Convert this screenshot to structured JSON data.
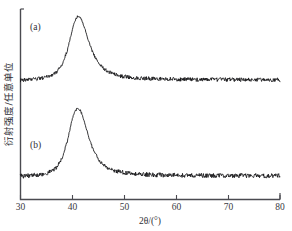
{
  "figure": {
    "kind": "xrd-pattern",
    "background_color": "#ffffff",
    "frame_color": "#4a4a50",
    "trace_color": "#121214"
  },
  "axes": {
    "x_title": "2θ/(°)",
    "y_title": "衍射强度/任意单位",
    "x_ticks": [
      "30",
      "40",
      "50",
      "60",
      "70",
      "80"
    ],
    "x_tick_values": [
      30,
      40,
      50,
      60,
      70,
      80
    ],
    "x_min": 30,
    "x_max": 80,
    "y_ticks": [],
    "y_tick_labels_shown": false
  },
  "annotations": {
    "curve_a_label": "(a)",
    "curve_b_label": "(b)"
  },
  "chart_data": {
    "type": "line",
    "title": "",
    "subtitle": "",
    "xlabel": "2θ/(°)",
    "ylabel": "衍射强度/任意单位",
    "xlim": [
      30,
      80
    ],
    "ylim": [
      0,
      2
    ],
    "grid": false,
    "legend": "none",
    "annotations": [
      {
        "text": "(a)",
        "x": 31.8,
        "y_frac": 0.88
      },
      {
        "text": "(b)",
        "x": 31.8,
        "y_frac": 0.32
      }
    ],
    "series": [
      {
        "name": "(a)",
        "peak_center": 41.2,
        "peak_fwhm": 7.6,
        "peak_height": 1.0,
        "baseline": 0.0,
        "offset": 1.0,
        "noise": 0.028,
        "x": [
          30,
          31,
          32,
          33,
          34,
          35,
          36,
          37,
          38,
          39,
          40,
          40.5,
          41,
          41.2,
          41.5,
          42,
          42.5,
          43,
          44,
          45,
          46,
          47,
          48,
          49,
          50,
          52,
          54,
          56,
          58,
          60,
          62,
          64,
          66,
          68,
          70,
          72,
          74,
          76,
          78,
          80
        ],
        "y": [
          0.03,
          0.033,
          0.038,
          0.045,
          0.056,
          0.074,
          0.104,
          0.155,
          0.262,
          0.47,
          0.8,
          0.93,
          0.995,
          1.0,
          0.985,
          0.9,
          0.78,
          0.65,
          0.43,
          0.29,
          0.205,
          0.152,
          0.118,
          0.096,
          0.082,
          0.064,
          0.054,
          0.048,
          0.044,
          0.041,
          0.039,
          0.038,
          0.037,
          0.036,
          0.035,
          0.035,
          0.034,
          0.034,
          0.033,
          0.033
        ]
      },
      {
        "name": "(b)",
        "peak_center": 41.0,
        "peak_fwhm": 7.2,
        "peak_height": 1.0,
        "baseline": 0.0,
        "offset": 0.0,
        "noise": 0.03,
        "x": [
          30,
          31,
          32,
          33,
          34,
          35,
          36,
          37,
          38,
          39,
          40,
          40.5,
          41,
          41.2,
          41.5,
          42,
          42.5,
          43,
          44,
          45,
          46,
          47,
          48,
          49,
          50,
          52,
          54,
          56,
          58,
          60,
          62,
          64,
          66,
          68,
          70,
          72,
          74,
          76,
          78,
          80
        ],
        "y": [
          0.028,
          0.03,
          0.034,
          0.04,
          0.05,
          0.068,
          0.1,
          0.156,
          0.28,
          0.52,
          0.85,
          0.95,
          1.0,
          0.995,
          0.97,
          0.88,
          0.755,
          0.62,
          0.4,
          0.268,
          0.188,
          0.14,
          0.11,
          0.09,
          0.076,
          0.06,
          0.05,
          0.045,
          0.042,
          0.04,
          0.038,
          0.037,
          0.036,
          0.035,
          0.035,
          0.034,
          0.034,
          0.033,
          0.033,
          0.032
        ]
      }
    ]
  }
}
